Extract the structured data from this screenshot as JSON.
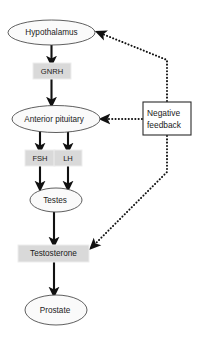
{
  "diagram": {
    "colors": {
      "ellipse_fill": "#fafafa",
      "ellipse_stroke": "#4d4d4d",
      "grey_box_fill": "#d9d9d9",
      "grey_box_stroke": "#ededed",
      "white_box_fill": "#ffffff",
      "white_box_stroke": "#2b2b2b",
      "edge_color": "#111111",
      "text_color": "#1a1a1a",
      "background": "#ffffff"
    },
    "nodes": [
      {
        "id": "hypothalamus",
        "label": "Hypothalamus",
        "shape": "ellipse",
        "cx": 51.5,
        "cy": 32.5,
        "rx": 43.5,
        "ry": 12.5
      },
      {
        "id": "gnrh",
        "label": "GNRH",
        "shape": "box",
        "x": 33,
        "y": 63,
        "w": 38,
        "h": 16
      },
      {
        "id": "anterior-pituitary",
        "label": "Anterior pituitary",
        "shape": "ellipse",
        "cx": 56,
        "cy": 119,
        "rx": 44,
        "ry": 13.5
      },
      {
        "id": "fsh",
        "label": "FSH",
        "shape": "box",
        "x": 25,
        "y": 150,
        "w": 30,
        "h": 16
      },
      {
        "id": "lh",
        "label": "LH",
        "shape": "box",
        "x": 54,
        "y": 150,
        "w": 28,
        "h": 16
      },
      {
        "id": "testes",
        "label": "Testes",
        "shape": "ellipse",
        "cx": 56,
        "cy": 200,
        "rx": 26,
        "ry": 12
      },
      {
        "id": "testosterone",
        "label": "Testosterone",
        "shape": "box",
        "x": 18,
        "y": 245,
        "w": 71,
        "h": 17
      },
      {
        "id": "prostate",
        "label": "Prostate",
        "shape": "ellipse",
        "cx": 56,
        "cy": 310,
        "rx": 31,
        "ry": 15
      },
      {
        "id": "negative-feedback",
        "label_line1": "Negative",
        "label_line2": "feedback",
        "shape": "box",
        "x": 143,
        "y": 102,
        "w": 48,
        "h": 33
      }
    ],
    "edges": [
      {
        "id": "hypothalamus-to-gnrh",
        "from": "hypothalamus",
        "to": "gnrh",
        "style": "solid"
      },
      {
        "id": "gnrh-to-anterior-pituitary",
        "from": "gnrh",
        "to": "anterior-pituitary",
        "style": "solid"
      },
      {
        "id": "anterior-pituitary-to-fsh",
        "from": "anterior-pituitary",
        "to": "fsh",
        "style": "solid"
      },
      {
        "id": "anterior-pituitary-to-lh",
        "from": "anterior-pituitary",
        "to": "lh",
        "style": "solid"
      },
      {
        "id": "fsh-to-testes",
        "from": "fsh",
        "to": "testes",
        "style": "solid"
      },
      {
        "id": "lh-to-testes",
        "from": "lh",
        "to": "testes",
        "style": "solid"
      },
      {
        "id": "testes-to-testosterone",
        "from": "testes",
        "to": "testosterone",
        "style": "solid"
      },
      {
        "id": "testosterone-to-prostate",
        "from": "testosterone",
        "to": "prostate",
        "style": "solid"
      },
      {
        "id": "feedback-to-hypothalamus",
        "from": "negative-feedback",
        "to": "hypothalamus",
        "style": "dotted"
      },
      {
        "id": "feedback-to-anterior-pituitary",
        "from": "negative-feedback",
        "to": "anterior-pituitary",
        "style": "dotted"
      },
      {
        "id": "testosterone-to-feedback",
        "from": "testosterone",
        "to": "negative-feedback",
        "style": "dotted"
      }
    ]
  }
}
